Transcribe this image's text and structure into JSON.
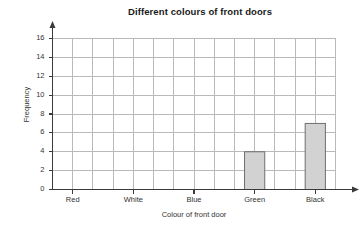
{
  "chart_data": {
    "type": "bar",
    "title": "Different colours of front doors",
    "xlabel": "Colour of front door",
    "ylabel": "Frequency",
    "categories": [
      "Red",
      "White",
      "Blue",
      "Green",
      "Black"
    ],
    "values": [
      0,
      0,
      0,
      4,
      7
    ],
    "ylim": [
      0,
      16
    ],
    "ytick_values": [
      0,
      2,
      4,
      6,
      8,
      10,
      12,
      14,
      16
    ],
    "ytick_labels": [
      "0",
      "2",
      "4",
      "6",
      "8",
      "10",
      "12",
      "14",
      "16"
    ],
    "grid": true,
    "legend": null,
    "bar_fill_color": "#d2d2d2",
    "bar_edge_color": "#6e6e6e",
    "grid_color": "#b9b9b9",
    "axis_color": "#3a3a3a"
  }
}
